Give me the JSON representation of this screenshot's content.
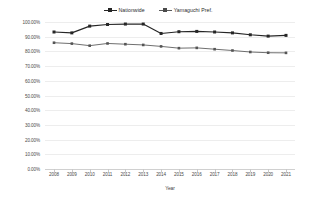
{
  "chart_data": {
    "type": "line",
    "title": "",
    "xlabel": "Year",
    "ylabel": "",
    "ylim": [
      0,
      100
    ],
    "grid": true,
    "legend_position": "top-center",
    "categories": [
      "2008",
      "2009",
      "2010",
      "2011",
      "2012",
      "2013",
      "2014",
      "2015",
      "2016",
      "2017",
      "2018",
      "2019",
      "2020",
      "2021"
    ],
    "ytick_labels": [
      "100.00%",
      "90.00%",
      "80.00%",
      "70.00%",
      "60.00%",
      "50.00%",
      "40.00%",
      "30.00%",
      "20.00%",
      "10.00%",
      "0.00%"
    ],
    "ytick_values": [
      100,
      90,
      80,
      70,
      60,
      50,
      40,
      30,
      20,
      10,
      0
    ],
    "series": [
      {
        "name": "Nationwide",
        "color": "#262626",
        "marker": "square",
        "values": [
          93.2,
          92.6,
          97.2,
          98.3,
          98.6,
          98.6,
          92.2,
          93.4,
          93.6,
          93.2,
          92.6,
          91.3,
          90.4,
          90.9
        ]
      },
      {
        "name": "Yamaguchi Pref.",
        "color": "#555555",
        "marker": "square",
        "values": [
          85.9,
          85.3,
          83.9,
          85.4,
          84.9,
          84.4,
          83.4,
          82.2,
          82.4,
          81.5,
          80.6,
          79.6,
          79.1,
          79.0
        ]
      }
    ]
  },
  "legend": {
    "items": [
      {
        "label": "Nationwide"
      },
      {
        "label": "Yamaguchi Pref."
      }
    ]
  },
  "axis": {
    "x_title": "Year"
  }
}
